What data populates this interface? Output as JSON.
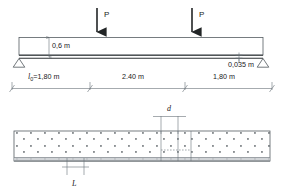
{
  "figure": {
    "type": "structural-beam-diagram",
    "title_present": false,
    "loads": [
      {
        "name": "point-load-left",
        "label": "P",
        "x_m": 1.8
      },
      {
        "name": "point-load-right",
        "label": "P",
        "x_m": 4.2
      }
    ],
    "beam": {
      "depth_label": "0,6 m",
      "bottom_layer_label": "0,035 m",
      "supports": [
        "pinned-left",
        "pinned-right"
      ]
    },
    "dimensions": [
      {
        "name": "span-left",
        "label": "l",
        "subscript": "0",
        "equals": "=1,80 m",
        "full": "l₀=1,80 m"
      },
      {
        "name": "span-middle",
        "label": "2.40 m"
      },
      {
        "name": "span-right",
        "label": "1,80 m"
      }
    ],
    "plan_view": {
      "hatch": "concrete-dot-stipple",
      "labels": [
        {
          "name": "dimension-d",
          "label": "d"
        },
        {
          "name": "dimension-L",
          "label": "L"
        }
      ]
    },
    "colors": {
      "line": "#555d62",
      "line_dark": "#2e3336",
      "text": "#1a1a1a",
      "hatch_band": "#c9cdd0"
    }
  }
}
